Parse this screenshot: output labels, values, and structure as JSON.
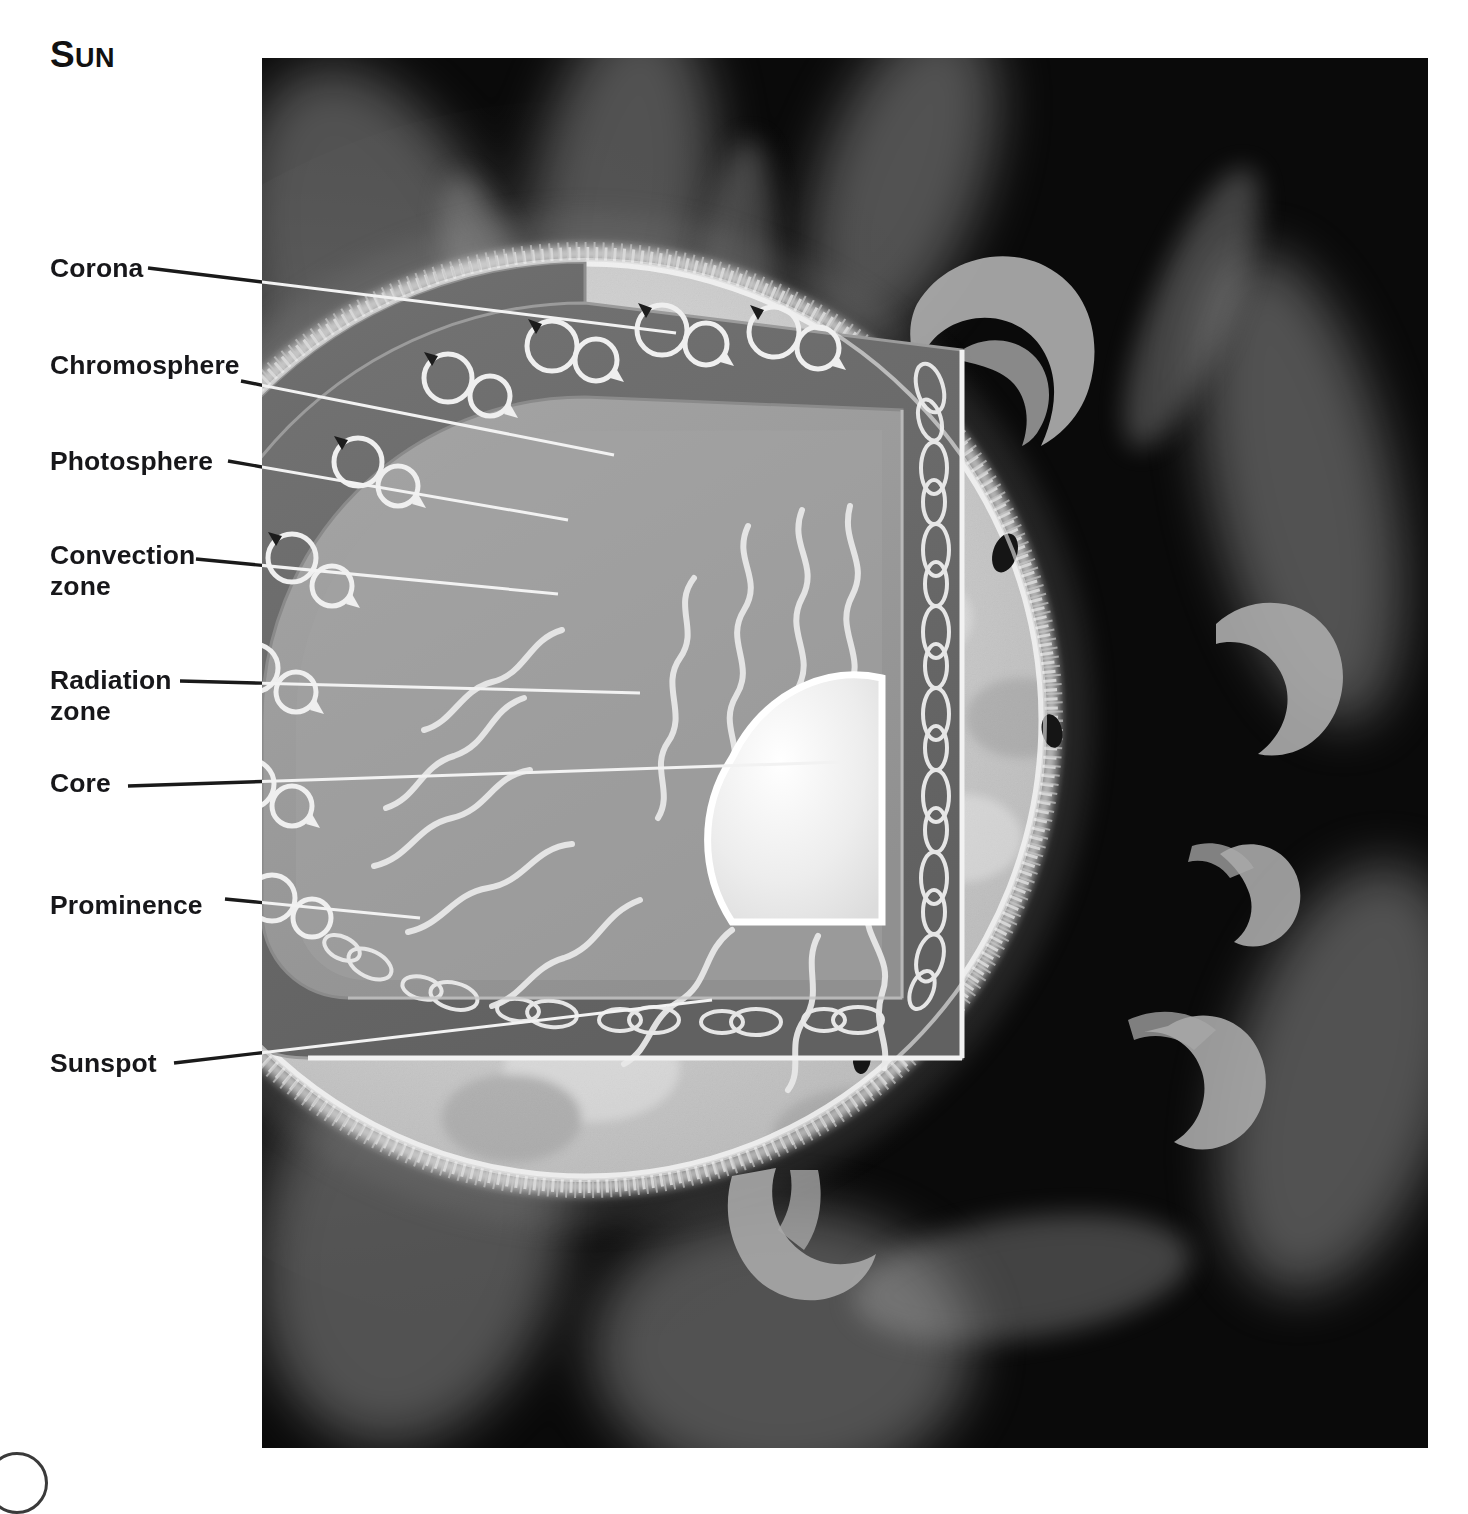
{
  "title": {
    "lead": "S",
    "rest": "UN",
    "full": "Sun"
  },
  "labels": [
    {
      "id": "corona",
      "text": "Corona",
      "x": 50,
      "y": 253,
      "lines": 1
    },
    {
      "id": "chromosphere",
      "text": "Chromosphere",
      "x": 50,
      "y": 350,
      "lines": 1
    },
    {
      "id": "photosphere",
      "text": "Photosphere",
      "x": 50,
      "y": 446,
      "lines": 1
    },
    {
      "id": "convection",
      "text": "Convection\nzone",
      "x": 50,
      "y": 540,
      "lines": 2
    },
    {
      "id": "radiation",
      "text": "Radiation\nzone",
      "x": 50,
      "y": 665,
      "lines": 2
    },
    {
      "id": "core",
      "text": "Core",
      "x": 50,
      "y": 768,
      "lines": 1
    },
    {
      "id": "prominence",
      "text": "Prominence",
      "x": 50,
      "y": 890,
      "lines": 1
    },
    {
      "id": "sunspot",
      "text": "Sunspot",
      "x": 50,
      "y": 1048,
      "lines": 1
    }
  ],
  "leaders": [
    {
      "id": "corona",
      "x1": 148,
      "y1": 268,
      "x2": 676,
      "y2": 333
    },
    {
      "id": "chromosphere",
      "x1": 241,
      "y1": 381,
      "x2": 614,
      "y2": 455
    },
    {
      "id": "photosphere",
      "x1": 228,
      "y1": 461,
      "x2": 568,
      "y2": 520
    },
    {
      "id": "convection",
      "x1": 196,
      "y1": 559,
      "x2": 558,
      "y2": 594
    },
    {
      "id": "radiation",
      "x1": 180,
      "y1": 681,
      "x2": 640,
      "y2": 693
    },
    {
      "id": "core",
      "x1": 128,
      "y1": 786,
      "x2": 842,
      "y2": 762
    },
    {
      "id": "prominence",
      "x1": 225,
      "y1": 899,
      "x2": 420,
      "y2": 918
    },
    {
      "id": "sunspot",
      "x1": 174,
      "y1": 1063,
      "x2": 712,
      "y2": 1000
    }
  ],
  "panel": {
    "x": 262,
    "y": 58,
    "width": 1166,
    "height": 1390,
    "background": "#0a0a0a"
  },
  "diagram": {
    "sun": {
      "cx": 585,
      "cy": 720,
      "r": 462
    },
    "layer_names": [
      "Corona",
      "Chromosphere",
      "Photosphere",
      "Convection zone",
      "Radiation zone",
      "Core"
    ],
    "feature_names": [
      "Prominence",
      "Sunspot"
    ],
    "cutaway": {
      "description": "quarter wedge removed from upper-left of sphere revealing interior layers"
    },
    "counts": {
      "prominences": 6,
      "sunspots": 6,
      "convection_cells": 27,
      "photon_paths": 11
    }
  },
  "colors": {
    "space": "#0a0a0a",
    "corona_glow": "#3e3e3e",
    "photosphere": "#c9c9c9",
    "photosphere_bright": "#dcdcdc",
    "chromosphere_rim": "#f0f0f0",
    "convection_zone": "#6e6e6e",
    "convection_zone_dark": "#5a5a5a",
    "radiation_zone": "#9a9a9a",
    "radiation_zone_face": "#a8a8a8",
    "core": "#ededed",
    "prominence": "#a6a6a6",
    "sunspot": "#151515",
    "leader_on_white": "#1a1a1a",
    "leader_on_dark": "#f2f2f2",
    "label_text": "#17171a"
  }
}
